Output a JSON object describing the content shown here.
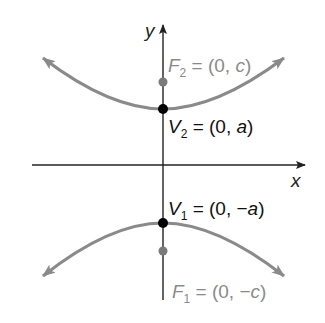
{
  "figure": {
    "colors": {
      "background": "#ffffff",
      "axis": "#222222",
      "curve": "#8a8a8a",
      "vertex": "#000000",
      "focus": "#7a7a7a",
      "vertex_label": "#111111",
      "focus_label": "#8a8a8a"
    }
  },
  "axes": {
    "x_label": "x",
    "y_label": "y"
  },
  "points": {
    "F2": {
      "name": "F",
      "sub": "2",
      "eq": " = (0, ",
      "var": "c",
      "close": ")"
    },
    "V2": {
      "name": "V",
      "sub": "2",
      "eq": " = (0, ",
      "var": "a",
      "close": ")"
    },
    "V1": {
      "name": "V",
      "sub": "1",
      "eq": " = (0, −",
      "var": "a",
      "close": ")"
    },
    "F1": {
      "name": "F",
      "sub": "1",
      "eq": " = (0, −",
      "var": "c",
      "close": ")"
    }
  }
}
